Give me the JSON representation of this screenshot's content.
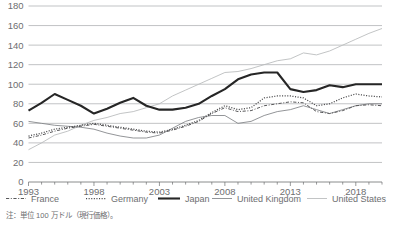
{
  "chart_data": {
    "type": "line",
    "title": "",
    "xlabel": "",
    "ylabel": "",
    "grid": true,
    "legend_position": "bottom",
    "ylim": [
      0,
      180
    ],
    "ytick_step": 20,
    "ytick_labels": [
      "180",
      "160",
      "140",
      "120",
      "100",
      "80",
      "60",
      "40",
      "20",
      "0"
    ],
    "ytick_values": [
      180,
      160,
      140,
      120,
      100,
      80,
      60,
      40,
      20,
      0
    ],
    "xlim": [
      1993,
      2020
    ],
    "xtick_labels": [
      "1993",
      "1998",
      "2003",
      "2008",
      "2013",
      "2018"
    ],
    "xtick_values": [
      1993,
      1998,
      2003,
      2008,
      2013,
      2018
    ],
    "x": [
      1993,
      1994,
      1995,
      1996,
      1997,
      1998,
      1999,
      2000,
      2001,
      2002,
      2003,
      2004,
      2005,
      2006,
      2007,
      2008,
      2009,
      2010,
      2011,
      2012,
      2013,
      2014,
      2015,
      2016,
      2017,
      2018,
      2019,
      2020
    ],
    "series": [
      {
        "name": "France",
        "style": "dash-dot",
        "color": "#58585a",
        "values": [
          45,
          48,
          52,
          55,
          57,
          59,
          57,
          55,
          53,
          51,
          50,
          53,
          57,
          62,
          70,
          76,
          72,
          73,
          78,
          80,
          82,
          81,
          72,
          70,
          73,
          78,
          79,
          78
        ]
      },
      {
        "name": "Germany",
        "style": "dotted",
        "color": "#4a4a4c",
        "values": [
          47,
          50,
          54,
          56,
          58,
          60,
          58,
          56,
          54,
          52,
          51,
          54,
          58,
          63,
          71,
          78,
          74,
          76,
          86,
          88,
          88,
          86,
          78,
          80,
          86,
          90,
          88,
          87
        ]
      },
      {
        "name": "Japan",
        "style": "solid-bold",
        "color": "#262626",
        "values": [
          73,
          81,
          90,
          84,
          78,
          70,
          75,
          81,
          86,
          78,
          74,
          74,
          76,
          80,
          88,
          95,
          105,
          110,
          112,
          112,
          95,
          92,
          94,
          99,
          97,
          100,
          100,
          100
        ]
      },
      {
        "name": "United Kingdom",
        "style": "solid-thin",
        "color": "#808285",
        "values": [
          62,
          60,
          58,
          57,
          56,
          54,
          50,
          47,
          45,
          45,
          48,
          55,
          62,
          66,
          68,
          68,
          60,
          62,
          68,
          72,
          74,
          78,
          74,
          70,
          74,
          78,
          80,
          80
        ]
      },
      {
        "name": "United States",
        "style": "solid-light",
        "color": "#b7b9bb",
        "values": [
          33,
          40,
          48,
          52,
          58,
          63,
          66,
          70,
          72,
          76,
          80,
          88,
          94,
          100,
          106,
          112,
          113,
          116,
          120,
          124,
          126,
          132,
          130,
          134,
          140,
          146,
          152,
          157
        ]
      }
    ]
  },
  "legend": {
    "items": [
      {
        "label": "France",
        "style": "dash-dot"
      },
      {
        "label": "Germany",
        "style": "dotted"
      },
      {
        "label": "Japan",
        "style": "solid-bold"
      },
      {
        "label": "United Kingdom",
        "style": "solid-thin"
      },
      {
        "label": "United States",
        "style": "solid-light"
      }
    ]
  },
  "note": {
    "text": "注：単位 100 万ドル（現行価格）。"
  }
}
